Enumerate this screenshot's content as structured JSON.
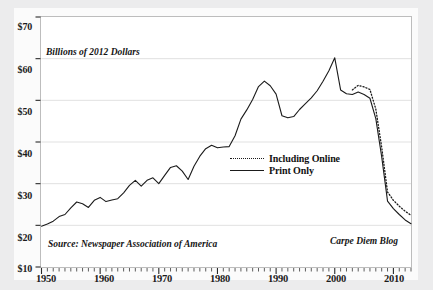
{
  "chart_data": {
    "type": "line",
    "title": "",
    "subtitle": "",
    "axis_note": "Billions of 2012 Dollars",
    "xlabel": "",
    "ylabel": "Billions of 2012 Dollars",
    "ylim": [
      10,
      70
    ],
    "xlim": [
      1950,
      2013
    ],
    "ytick_labels": [
      "$70",
      "$60",
      "$50",
      "$40",
      "$30",
      "$20",
      "$10"
    ],
    "ytick_values": [
      70,
      60,
      50,
      40,
      30,
      20,
      10
    ],
    "xtick_labels": [
      "1950",
      "1960",
      "1970",
      "1980",
      "1990",
      "2000",
      "2010"
    ],
    "xtick_values": [
      1950,
      1960,
      1970,
      1980,
      1990,
      2000,
      2010
    ],
    "minor_xticks_every": 1,
    "grid": "horizontal",
    "legend_position": "center-right",
    "legend": [
      "Including Online",
      "Print Only"
    ],
    "source": "Source: Newspaper Association of America",
    "credit": "Carpe Diem Blog",
    "series": [
      {
        "name": "Print Only",
        "style": "solid",
        "color": "#1b1b1b",
        "x": [
          1950,
          1951,
          1952,
          1953,
          1954,
          1955,
          1956,
          1957,
          1958,
          1959,
          1960,
          1961,
          1962,
          1963,
          1964,
          1965,
          1966,
          1967,
          1968,
          1969,
          1970,
          1971,
          1972,
          1973,
          1974,
          1975,
          1976,
          1977,
          1978,
          1979,
          1980,
          1981,
          1982,
          1983,
          1984,
          1985,
          1986,
          1987,
          1988,
          1989,
          1990,
          1991,
          1992,
          1993,
          1994,
          1995,
          1996,
          1997,
          1998,
          1999,
          2000,
          2001,
          2002,
          2003,
          2004,
          2005,
          2006,
          2007,
          2008,
          2009,
          2010,
          2011,
          2012,
          2013
        ],
        "values": [
          19.8,
          20.3,
          21.0,
          22.1,
          22.6,
          24.2,
          25.6,
          25.2,
          24.3,
          26.0,
          26.7,
          25.7,
          26.1,
          26.4,
          27.8,
          29.6,
          30.8,
          29.4,
          30.8,
          31.4,
          30.0,
          32.0,
          33.9,
          34.3,
          33.0,
          31.0,
          34.2,
          36.6,
          38.4,
          39.2,
          38.6,
          38.8,
          38.9,
          41.5,
          45.5,
          47.7,
          50.2,
          53.3,
          54.6,
          53.5,
          51.5,
          46.3,
          45.8,
          46.1,
          47.8,
          49.2,
          50.6,
          52.3,
          54.6,
          57.1,
          60.2,
          52.5,
          51.6,
          51.4,
          52.0,
          51.4,
          50.5,
          45.6,
          36.5,
          25.8,
          24.0,
          22.6,
          21.3,
          20.4
        ]
      },
      {
        "name": "Including Online",
        "style": "dotted",
        "color": "#1b1b1b",
        "x": [
          2003,
          2004,
          2005,
          2006,
          2007,
          2008,
          2009,
          2010,
          2011,
          2012,
          2013
        ],
        "values": [
          52.5,
          53.6,
          53.2,
          52.6,
          47.9,
          38.8,
          28.0,
          26.0,
          24.6,
          23.4,
          22.4
        ]
      }
    ],
    "annotations": [
      {
        "text": "Peak 1988",
        "value": 54.6
      },
      {
        "text": "Peak 2000",
        "value": 60.2
      }
    ]
  },
  "colors": {
    "page_background": "#ececed",
    "card_background": "#fbfbfb",
    "plot_background": "#ffffff",
    "border": "#bdbdbd",
    "gridline": "#d9d9d9",
    "line": "#1b1b1b",
    "text": "#141414"
  }
}
